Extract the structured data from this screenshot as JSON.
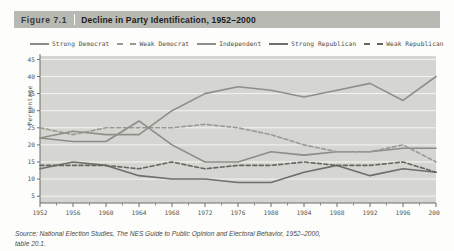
{
  "figure": {
    "number": "Figure  7.1",
    "title": "Decline in Party Identification, 1952–2000",
    "title_bar_color": "#b9b9b4"
  },
  "source_note": {
    "line1_prefix": "Source: National Election Studies, ",
    "line1_italic": "The NES Guide to Public Opinion and Electoral Behavior, 1952–2000,",
    "line2": "table 20.1."
  },
  "legend": {
    "items": [
      {
        "label": "Strong Democrat",
        "style": "solid",
        "color": "#8c8c88"
      },
      {
        "label": "Weak Democrat",
        "style": "dashed",
        "color": "#9a9a95"
      },
      {
        "label": "Independent",
        "style": "solid",
        "color": "#8f8f8a"
      },
      {
        "label": "Strong Republican",
        "style": "solid",
        "color": "#6e6e6a"
      },
      {
        "label": "Weak Republican",
        "style": "dashed",
        "color": "#66665f"
      }
    ]
  },
  "chart_data": {
    "type": "line",
    "title": "Decline in Party Identification, 1952–2000",
    "xlabel": "",
    "ylabel": "Percentage",
    "x": [
      1952,
      1956,
      1960,
      1964,
      1968,
      1972,
      1976,
      1980,
      1984,
      1988,
      1992,
      1996,
      2000
    ],
    "categories": [
      "1952",
      "1956",
      "1960",
      "1964",
      "1968",
      "1972",
      "1976",
      "1980",
      "1984",
      "1988",
      "1992",
      "1996",
      "2000"
    ],
    "xlim": [
      1952,
      2000
    ],
    "ylim": [
      3,
      46
    ],
    "yticks": [
      5,
      10,
      15,
      20,
      25,
      30,
      35,
      40,
      45
    ],
    "grid": "horizontal",
    "legend_position": "top",
    "series": [
      {
        "name": "Strong Democrat",
        "style": "solid",
        "color": "#8c8c88",
        "values": [
          22,
          21,
          21,
          27,
          20,
          15,
          15,
          18,
          17,
          18,
          18,
          19,
          19
        ]
      },
      {
        "name": "Weak Democrat",
        "style": "dashed",
        "color": "#9a9a95",
        "values": [
          25,
          23,
          25,
          25,
          25,
          26,
          25,
          23,
          20,
          18,
          18,
          20,
          15
        ]
      },
      {
        "name": "Independent",
        "style": "solid",
        "color": "#8f8f8a",
        "values": [
          22,
          24,
          23,
          23,
          30,
          35,
          37,
          36,
          34,
          36,
          38,
          33,
          40
        ]
      },
      {
        "name": "Strong Republican",
        "style": "solid",
        "color": "#6e6e6a",
        "values": [
          13,
          15,
          14,
          11,
          10,
          10,
          9,
          9,
          12,
          14,
          11,
          13,
          12
        ]
      },
      {
        "name": "Weak Republican",
        "style": "dashed",
        "color": "#66665f",
        "values": [
          14,
          14,
          14,
          13,
          15,
          13,
          14,
          14,
          15,
          14,
          14,
          15,
          12
        ]
      }
    ]
  }
}
